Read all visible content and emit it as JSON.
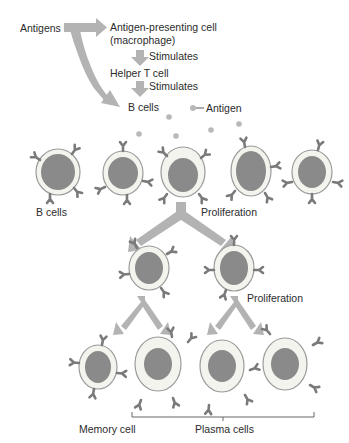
{
  "flow": {
    "antigens": "Antigens",
    "apc_line1": "Antigen-presenting cell",
    "apc_line2": "(macrophage)",
    "stimulates_1": "Stimulates",
    "helper_t": "Helper T cell",
    "stimulates_2": "Stimulates",
    "b_cells_top": "B cells",
    "antigen_legend": "Antigen"
  },
  "labels": {
    "b_cells": "B cells",
    "proliferation_1": "Proliferation",
    "proliferation_2": "Proliferation",
    "memory_cell": "Memory cell",
    "plasma_cells": "Plasma cells"
  },
  "colors": {
    "arrow": "#b3b3b3",
    "cytoplasm": "#f4f4ee",
    "membrane": "#9a9a9a",
    "nucleus": "#8a8a8a",
    "antibody": "#7a7a7a",
    "antigen": "#b8b8b8"
  }
}
